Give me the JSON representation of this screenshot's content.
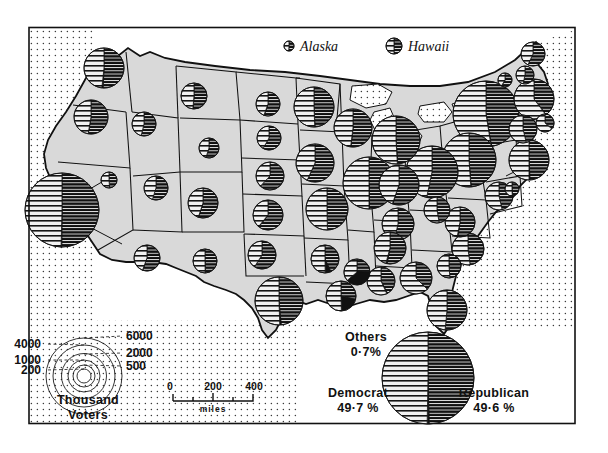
{
  "figure": {
    "kind": "thematic-map",
    "background_color": "#ffffff",
    "land_color": "#d9d9d9",
    "ink_color": "#111111"
  },
  "inset_labels": [
    {
      "name": "alaska",
      "text": "Alaska"
    },
    {
      "name": "hawaii",
      "text": "Hawaii"
    }
  ],
  "national_summary": {
    "democrat_label": "Democrat",
    "democrat_value": "49·7 %",
    "republican_label": "Republican",
    "republican_value": "49·6 %",
    "others_label": "Others",
    "others_value": "0·7%"
  },
  "size_legend": {
    "title_line1": "Thousand",
    "title_line2": "Voters",
    "ticks_left": [
      "4000",
      "1000",
      "200"
    ],
    "ticks_right": [
      "6000",
      "2000",
      "500"
    ]
  },
  "scale_bar": {
    "ticks": [
      "0",
      "200",
      "400"
    ],
    "unit": "miles"
  },
  "chart_data": {
    "type": "pie",
    "legend_position": "bottom-left",
    "units": "thousand voters",
    "series_names": [
      "Democrat",
      "Republican",
      "Others"
    ],
    "national": {
      "Democrat": 49.7,
      "Republican": 49.6,
      "Others": 0.7
    },
    "size_legend_breaks": [
      200,
      500,
      1000,
      2000,
      4000,
      6000
    ],
    "scale_bar_miles": [
      0,
      200,
      400
    ],
    "states": [
      {
        "code": "WA",
        "cx": 104,
        "cy": 68,
        "r": 20,
        "dem": 48.3,
        "rep": 50.7,
        "oth": 1.0
      },
      {
        "code": "OR",
        "cx": 91,
        "cy": 117,
        "r": 17,
        "dem": 47.3,
        "rep": 52.6,
        "oth": 0.1
      },
      {
        "code": "CA",
        "cx": 62,
        "cy": 210,
        "r": 37,
        "dem": 49.6,
        "rep": 50.1,
        "oth": 0.3
      },
      {
        "code": "NV",
        "cx": 109,
        "cy": 180,
        "r": 8,
        "dem": 51.2,
        "rep": 48.8,
        "oth": 0.0
      },
      {
        "code": "ID",
        "cx": 144,
        "cy": 124,
        "r": 12,
        "dem": 46.2,
        "rep": 53.8,
        "oth": 0.0
      },
      {
        "code": "MT",
        "cx": 194,
        "cy": 96,
        "r": 13,
        "dem": 48.6,
        "rep": 51.1,
        "oth": 0.3
      },
      {
        "code": "WY",
        "cx": 209,
        "cy": 148,
        "r": 10,
        "dem": 45.0,
        "rep": 55.0,
        "oth": 0.0
      },
      {
        "code": "UT",
        "cx": 156,
        "cy": 188,
        "r": 12,
        "dem": 45.2,
        "rep": 54.8,
        "oth": 0.0
      },
      {
        "code": "AZ",
        "cx": 147,
        "cy": 258,
        "r": 13,
        "dem": 44.4,
        "rep": 55.5,
        "oth": 0.1
      },
      {
        "code": "NM",
        "cx": 205,
        "cy": 261,
        "r": 12,
        "dem": 50.2,
        "rep": 49.4,
        "oth": 0.4
      },
      {
        "code": "CO",
        "cx": 203,
        "cy": 203,
        "r": 15,
        "dem": 44.9,
        "rep": 54.6,
        "oth": 0.5
      },
      {
        "code": "ND",
        "cx": 268,
        "cy": 104,
        "r": 12,
        "dem": 44.5,
        "rep": 55.4,
        "oth": 0.1
      },
      {
        "code": "SD",
        "cx": 269,
        "cy": 138,
        "r": 12,
        "dem": 41.8,
        "rep": 58.2,
        "oth": 0.0
      },
      {
        "code": "NE",
        "cx": 270,
        "cy": 176,
        "r": 14,
        "dem": 37.9,
        "rep": 62.1,
        "oth": 0.0
      },
      {
        "code": "KS",
        "cx": 268,
        "cy": 215,
        "r": 15,
        "dem": 39.1,
        "rep": 60.4,
        "oth": 0.5
      },
      {
        "code": "OK",
        "cx": 262,
        "cy": 255,
        "r": 14,
        "dem": 41.0,
        "rep": 59.0,
        "oth": 0.0
      },
      {
        "code": "TX",
        "cx": 279,
        "cy": 301,
        "r": 24,
        "dem": 50.5,
        "rep": 48.5,
        "oth": 1.0
      },
      {
        "code": "MN",
        "cx": 314,
        "cy": 107,
        "r": 20,
        "dem": 50.6,
        "rep": 49.2,
        "oth": 0.2
      },
      {
        "code": "IA",
        "cx": 315,
        "cy": 163,
        "r": 19,
        "dem": 43.2,
        "rep": 56.7,
        "oth": 0.1
      },
      {
        "code": "MO",
        "cx": 327,
        "cy": 209,
        "r": 21,
        "dem": 50.3,
        "rep": 49.7,
        "oth": 0.0
      },
      {
        "code": "AR",
        "cx": 325,
        "cy": 259,
        "r": 14,
        "dem": 50.2,
        "rep": 43.1,
        "oth": 6.7
      },
      {
        "code": "LA",
        "cx": 341,
        "cy": 296,
        "r": 15,
        "dem": 50.4,
        "rep": 28.6,
        "oth": 21.0
      },
      {
        "code": "WI",
        "cx": 353,
        "cy": 128,
        "r": 19,
        "dem": 48.0,
        "rep": 51.8,
        "oth": 0.2
      },
      {
        "code": "IL",
        "cx": 369,
        "cy": 183,
        "r": 26,
        "dem": 50.0,
        "rep": 49.8,
        "oth": 0.2
      },
      {
        "code": "MS",
        "cx": 357,
        "cy": 272,
        "r": 13,
        "dem": 36.3,
        "rep": 24.7,
        "oth": 39.0
      },
      {
        "code": "MI",
        "cx": 396,
        "cy": 140,
        "r": 24,
        "dem": 50.9,
        "rep": 48.8,
        "oth": 0.3
      },
      {
        "code": "IN",
        "cx": 399,
        "cy": 185,
        "r": 20,
        "dem": 44.6,
        "rep": 55.0,
        "oth": 0.4
      },
      {
        "code": "KY",
        "cx": 398,
        "cy": 224,
        "r": 16,
        "dem": 46.4,
        "rep": 53.6,
        "oth": 0.0
      },
      {
        "code": "TN",
        "cx": 390,
        "cy": 248,
        "r": 16,
        "dem": 45.8,
        "rep": 52.9,
        "oth": 1.3
      },
      {
        "code": "AL",
        "cx": 381,
        "cy": 281,
        "r": 14,
        "dem": 56.8,
        "rep": 42.2,
        "oth": 1.0
      },
      {
        "code": "OH",
        "cx": 432,
        "cy": 172,
        "r": 26,
        "dem": 46.7,
        "rep": 53.3,
        "oth": 0.0
      },
      {
        "code": "GA",
        "cx": 416,
        "cy": 278,
        "r": 16,
        "dem": 62.5,
        "rep": 37.4,
        "oth": 0.1
      },
      {
        "code": "FL",
        "cx": 447,
        "cy": 310,
        "r": 20,
        "dem": 48.5,
        "rep": 51.5,
        "oth": 0.0
      },
      {
        "code": "WV",
        "cx": 437,
        "cy": 210,
        "r": 13,
        "dem": 52.7,
        "rep": 47.3,
        "oth": 0.0
      },
      {
        "code": "VA",
        "cx": 460,
        "cy": 222,
        "r": 15,
        "dem": 47.0,
        "rep": 52.4,
        "oth": 0.6
      },
      {
        "code": "NC",
        "cx": 468,
        "cy": 249,
        "r": 16,
        "dem": 52.1,
        "rep": 47.9,
        "oth": 0.0
      },
      {
        "code": "SC",
        "cx": 449,
        "cy": 266,
        "r": 12,
        "dem": 51.2,
        "rep": 48.8,
        "oth": 0.0
      },
      {
        "code": "PA",
        "cx": 469,
        "cy": 160,
        "r": 27,
        "dem": 51.1,
        "rep": 48.7,
        "oth": 0.2
      },
      {
        "code": "NY",
        "cx": 486,
        "cy": 114,
        "r": 33,
        "dem": 52.5,
        "rep": 47.3,
        "oth": 0.2
      },
      {
        "code": "VT",
        "cx": 505,
        "cy": 80,
        "r": 7,
        "dem": 41.3,
        "rep": 58.6,
        "oth": 0.1
      },
      {
        "code": "NH",
        "cx": 525,
        "cy": 75,
        "r": 9,
        "dem": 46.6,
        "rep": 53.4,
        "oth": 0.0
      },
      {
        "code": "ME",
        "cx": 533,
        "cy": 54,
        "r": 12,
        "dem": 43.0,
        "rep": 57.0,
        "oth": 0.0
      },
      {
        "code": "MA",
        "cx": 534,
        "cy": 99,
        "r": 20,
        "dem": 60.2,
        "rep": 39.6,
        "oth": 0.2
      },
      {
        "code": "RI",
        "cx": 545,
        "cy": 123,
        "r": 9,
        "dem": 63.6,
        "rep": 36.4,
        "oth": 0.0
      },
      {
        "code": "CT",
        "cx": 523,
        "cy": 129,
        "r": 14,
        "dem": 53.7,
        "rep": 46.3,
        "oth": 0.0
      },
      {
        "code": "NJ",
        "cx": 529,
        "cy": 160,
        "r": 20,
        "dem": 50.0,
        "rep": 49.2,
        "oth": 0.8
      },
      {
        "code": "DE",
        "cx": 512,
        "cy": 189,
        "r": 7,
        "dem": 50.6,
        "rep": 49.0,
        "oth": 0.4
      },
      {
        "code": "MD",
        "cx": 499,
        "cy": 196,
        "r": 14,
        "dem": 53.6,
        "rep": 46.4,
        "oth": 0.0
      },
      {
        "code": "AK",
        "cx": 289,
        "cy": 46,
        "r": 5,
        "dem": 49.1,
        "rep": 50.9,
        "oth": 0.0
      },
      {
        "code": "HI",
        "cx": 394,
        "cy": 46,
        "r": 8,
        "dem": 50.0,
        "rep": 50.0,
        "oth": 0.0
      }
    ]
  }
}
